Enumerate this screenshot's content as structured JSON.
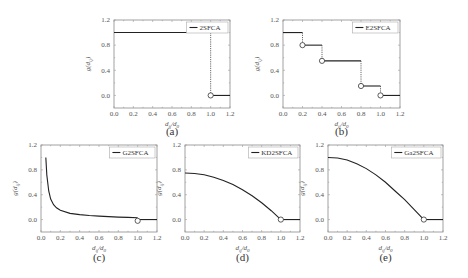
{
  "figure": {
    "ylabel": "g(dij)",
    "xlabel": "dij/d0",
    "xticks": [
      "0.0",
      "0.2",
      "0.4",
      "0.6",
      "0.8",
      "1.0",
      "1.2"
    ],
    "yticks": [
      "0.0",
      "0.4",
      "0.8",
      "1.2"
    ]
  },
  "chart_data": [
    {
      "id": "a",
      "type": "line",
      "panel_label": "(a)",
      "legend": "2SFCA",
      "xlabel": "d_ij/d_0",
      "ylabel": "g(d_ij)",
      "xlim": [
        0,
        1.2
      ],
      "ylim": [
        -0.2,
        1.2
      ],
      "segments": [
        {
          "x": [
            0.0,
            1.0
          ],
          "y": [
            1.0,
            1.0
          ]
        },
        {
          "x": [
            1.0,
            1.2
          ],
          "y": [
            0.0,
            0.0
          ]
        }
      ],
      "dotted_drops": [
        {
          "x": 1.0,
          "from": 1.0,
          "to": 0.0
        }
      ],
      "open_circles": [
        {
          "x": 1.0,
          "y": 0.0
        }
      ]
    },
    {
      "id": "b",
      "type": "line",
      "panel_label": "(b)",
      "legend": "E2SFCA",
      "xlabel": "d_ij/d_0",
      "ylabel": "g(d_ij)",
      "xlim": [
        0,
        1.2
      ],
      "ylim": [
        -0.2,
        1.2
      ],
      "segments": [
        {
          "x": [
            0.0,
            0.2
          ],
          "y": [
            1.0,
            1.0
          ]
        },
        {
          "x": [
            0.2,
            0.4
          ],
          "y": [
            0.8,
            0.8
          ]
        },
        {
          "x": [
            0.4,
            0.8
          ],
          "y": [
            0.55,
            0.55
          ]
        },
        {
          "x": [
            0.8,
            1.0
          ],
          "y": [
            0.15,
            0.15
          ]
        },
        {
          "x": [
            1.0,
            1.2
          ],
          "y": [
            0.0,
            0.0
          ]
        }
      ],
      "dotted_drops": [
        {
          "x": 0.2,
          "from": 1.0,
          "to": 0.8
        },
        {
          "x": 0.4,
          "from": 0.8,
          "to": 0.55
        },
        {
          "x": 0.8,
          "from": 0.55,
          "to": 0.15
        },
        {
          "x": 1.0,
          "from": 0.15,
          "to": 0.0
        }
      ],
      "open_circles": [
        {
          "x": 0.2,
          "y": 0.8
        },
        {
          "x": 0.4,
          "y": 0.55
        },
        {
          "x": 0.8,
          "y": 0.15
        },
        {
          "x": 1.0,
          "y": 0.0
        }
      ]
    },
    {
      "id": "c",
      "type": "line",
      "panel_label": "(c)",
      "legend": "G2SFCA",
      "xlabel": "d_ij/d_0",
      "ylabel": "g(d_ij)",
      "xlim": [
        0,
        1.2
      ],
      "ylim": [
        -0.2,
        1.2
      ],
      "x": [
        0.05,
        0.06,
        0.08,
        0.1,
        0.13,
        0.16,
        0.2,
        0.3,
        0.4,
        0.5,
        0.6,
        0.7,
        0.8,
        0.9,
        1.0
      ],
      "y": [
        1.0,
        0.72,
        0.46,
        0.33,
        0.24,
        0.19,
        0.15,
        0.1,
        0.08,
        0.065,
        0.055,
        0.047,
        0.04,
        0.035,
        0.03
      ],
      "tail": {
        "x": [
          1.0,
          1.2
        ],
        "y": [
          0.0,
          0.0
        ]
      },
      "open_circles": [
        {
          "x": 1.0,
          "y": -0.02
        }
      ]
    },
    {
      "id": "d",
      "type": "line",
      "panel_label": "(d)",
      "legend": "KD2SFCA",
      "xlabel": "d_ij/d_0",
      "ylabel": "g(d_ij)",
      "xlim": [
        0,
        1.2
      ],
      "ylim": [
        -0.2,
        1.2
      ],
      "x": [
        0.0,
        0.1,
        0.2,
        0.3,
        0.4,
        0.5,
        0.6,
        0.7,
        0.8,
        0.9,
        1.0
      ],
      "y": [
        0.75,
        0.7425,
        0.72,
        0.6825,
        0.63,
        0.5625,
        0.48,
        0.3825,
        0.27,
        0.1425,
        0.0
      ],
      "tail": {
        "x": [
          1.0,
          1.2
        ],
        "y": [
          0.0,
          0.0
        ]
      },
      "open_circles": [
        {
          "x": 1.0,
          "y": 0.0
        }
      ]
    },
    {
      "id": "e",
      "type": "line",
      "panel_label": "(e)",
      "legend": "Ga2SFCA",
      "xlabel": "d_ij/d_0",
      "ylabel": "g(d_ij)",
      "xlim": [
        0,
        1.2
      ],
      "ylim": [
        -0.2,
        1.2
      ],
      "x": [
        0.0,
        0.1,
        0.2,
        0.3,
        0.4,
        0.5,
        0.6,
        0.7,
        0.8,
        0.9,
        1.0
      ],
      "y": [
        1.0,
        0.99,
        0.96,
        0.9,
        0.82,
        0.72,
        0.6,
        0.46,
        0.32,
        0.16,
        0.0
      ],
      "tail": {
        "x": [
          1.0,
          1.2
        ],
        "y": [
          0.0,
          0.0
        ]
      },
      "open_circles": [
        {
          "x": 1.0,
          "y": 0.0
        }
      ]
    }
  ]
}
